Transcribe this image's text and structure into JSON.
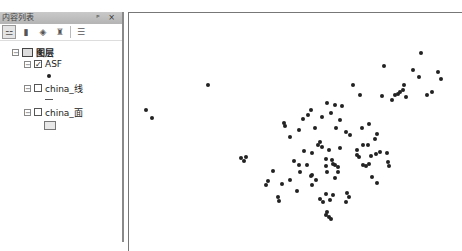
{
  "toc": {
    "title": "内容列表",
    "pin_label": "ᵖ",
    "close_label": "×",
    "toolbar": [
      {
        "name": "list-by-drawing-order",
        "glyph": "⚍",
        "active": true
      },
      {
        "name": "list-by-source",
        "glyph": "▮",
        "active": false
      },
      {
        "name": "list-by-visibility",
        "glyph": "◈",
        "active": false
      },
      {
        "name": "list-by-selection",
        "glyph": "♜",
        "active": false
      },
      {
        "name": "options",
        "glyph": "☰",
        "active": false
      }
    ],
    "root": {
      "label": "图层",
      "expanded": true
    },
    "layers": [
      {
        "label": "ASF",
        "checked": true,
        "expanded": true,
        "symbol": "point"
      },
      {
        "label": "china_线",
        "checked": false,
        "expanded": true,
        "symbol": "line"
      },
      {
        "label": "china_面",
        "checked": false,
        "expanded": true,
        "symbol": "polygon"
      }
    ]
  },
  "map": {
    "points": [
      [
        208,
        85
      ],
      [
        146,
        110
      ],
      [
        152,
        118
      ],
      [
        241,
        158
      ],
      [
        246,
        157
      ],
      [
        244,
        161
      ],
      [
        353,
        85
      ],
      [
        360,
        95
      ],
      [
        327,
        103
      ],
      [
        335,
        105
      ],
      [
        342,
        106
      ],
      [
        421,
        53
      ],
      [
        384,
        66
      ],
      [
        413,
        70
      ],
      [
        438,
        72
      ],
      [
        419,
        77
      ],
      [
        441,
        79
      ],
      [
        404,
        85
      ],
      [
        382,
        96
      ],
      [
        400,
        92
      ],
      [
        427,
        95
      ],
      [
        432,
        92
      ],
      [
        406,
        97
      ],
      [
        395,
        95
      ],
      [
        398,
        94
      ],
      [
        392,
        100
      ],
      [
        403,
        90
      ],
      [
        311,
        110
      ],
      [
        308,
        115
      ],
      [
        303,
        119
      ],
      [
        284,
        123
      ],
      [
        285,
        126
      ],
      [
        299,
        130
      ],
      [
        290,
        137
      ],
      [
        315,
        128
      ],
      [
        322,
        117
      ],
      [
        331,
        113
      ],
      [
        340,
        120
      ],
      [
        336,
        128
      ],
      [
        346,
        132
      ],
      [
        350,
        135
      ],
      [
        362,
        128
      ],
      [
        363,
        145
      ],
      [
        320,
        142
      ],
      [
        329,
        150
      ],
      [
        340,
        148
      ],
      [
        304,
        151
      ],
      [
        312,
        153
      ],
      [
        318,
        145
      ],
      [
        322,
        147
      ],
      [
        326,
        159
      ],
      [
        335,
        165
      ],
      [
        332,
        160
      ],
      [
        357,
        150
      ],
      [
        359,
        157
      ],
      [
        363,
        165
      ],
      [
        369,
        124
      ],
      [
        377,
        134
      ],
      [
        375,
        139
      ],
      [
        368,
        145
      ],
      [
        357,
        155
      ],
      [
        366,
        166
      ],
      [
        371,
        156
      ],
      [
        376,
        154
      ],
      [
        380,
        152
      ],
      [
        387,
        153
      ],
      [
        388,
        162
      ],
      [
        389,
        166
      ],
      [
        372,
        177
      ],
      [
        377,
        183
      ],
      [
        307,
        165
      ],
      [
        326,
        166
      ],
      [
        333,
        164
      ],
      [
        338,
        167
      ],
      [
        338,
        172
      ],
      [
        327,
        172
      ],
      [
        312,
        175
      ],
      [
        316,
        180
      ],
      [
        312,
        185
      ],
      [
        335,
        178
      ],
      [
        326,
        194
      ],
      [
        333,
        195
      ],
      [
        320,
        199
      ],
      [
        323,
        202
      ],
      [
        330,
        200
      ],
      [
        347,
        193
      ],
      [
        349,
        197
      ],
      [
        346,
        202
      ],
      [
        327,
        212
      ],
      [
        329,
        217
      ],
      [
        331,
        219
      ],
      [
        326,
        215
      ],
      [
        369,
        164
      ],
      [
        294,
        161
      ],
      [
        299,
        165
      ],
      [
        300,
        172
      ],
      [
        273,
        171
      ],
      [
        268,
        181
      ],
      [
        266,
        185
      ],
      [
        282,
        184
      ],
      [
        290,
        180
      ],
      [
        297,
        191
      ],
      [
        278,
        197
      ],
      [
        279,
        201
      ],
      [
        311,
        176
      ]
    ]
  }
}
